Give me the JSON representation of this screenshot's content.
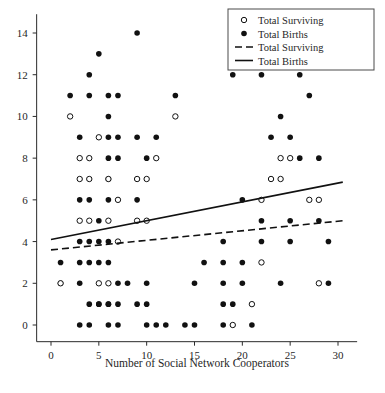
{
  "chart_data": {
    "type": "scatter",
    "title": "",
    "xlabel": "Number of Social Network Cooperators",
    "ylabel": "",
    "xlim": [
      -1.5,
      32
    ],
    "ylim": [
      -0.8,
      14.9
    ],
    "xticks": [
      0,
      5,
      10,
      15,
      20,
      25,
      30
    ],
    "xtick_labels": [
      "0",
      "5",
      "10",
      "15",
      "20",
      "25",
      "30"
    ],
    "yticks": [
      0,
      2,
      4,
      6,
      8,
      10,
      12,
      14
    ],
    "ytick_labels": [
      "0",
      "2",
      "4",
      "6",
      "8",
      "10",
      "12",
      "14"
    ],
    "grid": false,
    "legend_position": "top-right",
    "legend": [
      {
        "label": "Total Surviving",
        "marker": "open-circle",
        "kind": "marker"
      },
      {
        "label": "Total Births",
        "marker": "filled-circle",
        "kind": "marker"
      },
      {
        "label": "Total Surviving",
        "marker": "dashed-line",
        "kind": "line"
      },
      {
        "label": "Total Births",
        "marker": "solid-line",
        "kind": "line"
      }
    ],
    "series": [
      {
        "name": "Total Births",
        "marker": "filled-circle",
        "points": [
          [
            9,
            14
          ],
          [
            23,
            14
          ],
          [
            5,
            13
          ],
          [
            4,
            12
          ],
          [
            19,
            12
          ],
          [
            22,
            12
          ],
          [
            26,
            12
          ],
          [
            2,
            11
          ],
          [
            4,
            11
          ],
          [
            6,
            11
          ],
          [
            7,
            11
          ],
          [
            13,
            11
          ],
          [
            27,
            11
          ],
          [
            6,
            10
          ],
          [
            24,
            10
          ],
          [
            3,
            9
          ],
          [
            6,
            9
          ],
          [
            7,
            9
          ],
          [
            9,
            9
          ],
          [
            11,
            9
          ],
          [
            23,
            9
          ],
          [
            25,
            9
          ],
          [
            6,
            8
          ],
          [
            7,
            8
          ],
          [
            10,
            8
          ],
          [
            26,
            8
          ],
          [
            28,
            8
          ],
          [
            6,
            7
          ],
          [
            3,
            6
          ],
          [
            4,
            6
          ],
          [
            6,
            6
          ],
          [
            9,
            6
          ],
          [
            20,
            6
          ],
          [
            5,
            5
          ],
          [
            22,
            5
          ],
          [
            25,
            5
          ],
          [
            28,
            5
          ],
          [
            3,
            4
          ],
          [
            4,
            4
          ],
          [
            5,
            4
          ],
          [
            6,
            4
          ],
          [
            18,
            4
          ],
          [
            22,
            4
          ],
          [
            25,
            4
          ],
          [
            29,
            4
          ],
          [
            1,
            3
          ],
          [
            3,
            3
          ],
          [
            4,
            3
          ],
          [
            5,
            3
          ],
          [
            6,
            3
          ],
          [
            16,
            3
          ],
          [
            18,
            3
          ],
          [
            20,
            3
          ],
          [
            1,
            2
          ],
          [
            3,
            2
          ],
          [
            7,
            2
          ],
          [
            8,
            2
          ],
          [
            10,
            2
          ],
          [
            15,
            2
          ],
          [
            18,
            2
          ],
          [
            20,
            2
          ],
          [
            24,
            2
          ],
          [
            29,
            2
          ],
          [
            5,
            1
          ],
          [
            6,
            1
          ],
          [
            7,
            1
          ],
          [
            10,
            1
          ],
          [
            19,
            1
          ],
          [
            4,
            1
          ],
          [
            5,
            1
          ],
          [
            6,
            1
          ],
          [
            9,
            1
          ],
          [
            18,
            1
          ],
          [
            3,
            0
          ],
          [
            4,
            0
          ],
          [
            6,
            0
          ],
          [
            7,
            0
          ],
          [
            10,
            0
          ],
          [
            11,
            0
          ],
          [
            12,
            0
          ],
          [
            14,
            0
          ],
          [
            15,
            0
          ],
          [
            18,
            0
          ],
          [
            21,
            0
          ]
        ]
      },
      {
        "name": "Total Surviving",
        "marker": "open-circle",
        "points": [
          [
            2,
            10
          ],
          [
            13,
            10
          ],
          [
            5,
            9
          ],
          [
            3,
            8
          ],
          [
            4,
            8
          ],
          [
            11,
            8
          ],
          [
            24,
            8
          ],
          [
            25,
            8
          ],
          [
            3,
            7
          ],
          [
            4,
            7
          ],
          [
            9,
            7
          ],
          [
            10,
            7
          ],
          [
            23,
            7
          ],
          [
            24,
            7
          ],
          [
            6,
            7
          ],
          [
            27,
            6
          ],
          [
            7,
            6
          ],
          [
            22,
            6
          ],
          [
            28,
            6
          ],
          [
            3,
            5
          ],
          [
            4,
            5
          ],
          [
            6,
            5
          ],
          [
            9,
            5
          ],
          [
            10,
            5
          ],
          [
            7,
            4
          ],
          [
            22,
            3
          ],
          [
            1,
            2
          ],
          [
            5,
            2
          ],
          [
            6,
            2
          ],
          [
            28,
            2
          ],
          [
            21,
            1
          ],
          [
            19,
            0
          ]
        ]
      }
    ],
    "trend_lines": [
      {
        "name": "Total Births",
        "style": "solid",
        "x0": 0,
        "y0": 4.1,
        "x1": 30.5,
        "y1": 6.85
      },
      {
        "name": "Total Surviving",
        "style": "dashed",
        "x0": 0,
        "y0": 3.6,
        "x1": 30.5,
        "y1": 5.0
      }
    ]
  }
}
